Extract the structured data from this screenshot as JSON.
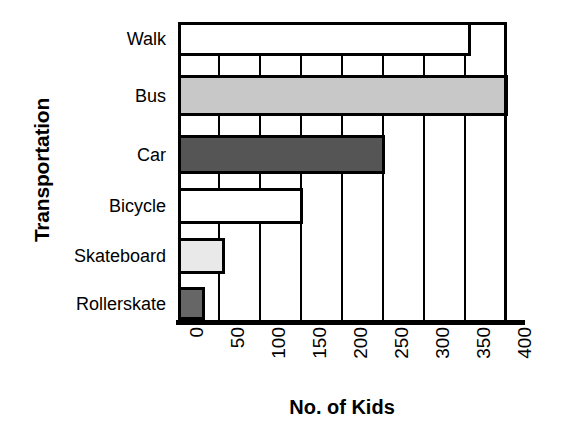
{
  "chart_data": {
    "type": "bar",
    "orientation": "horizontal",
    "title": "",
    "xlabel": "No. of Kids",
    "ylabel": "Transportation",
    "categories": [
      "Walk",
      "Bus",
      "Car",
      "Bicycle",
      "Skateboard",
      "Rollerskate"
    ],
    "values": [
      355,
      400,
      250,
      150,
      55,
      30
    ],
    "xlim": [
      0,
      400
    ],
    "xticks": [
      0,
      50,
      100,
      150,
      200,
      250,
      300,
      350,
      400
    ],
    "xtick_labels": [
      "0",
      "50",
      "100",
      "150",
      "200",
      "250",
      "300",
      "350",
      "400"
    ],
    "grid": true,
    "grid_axis": "x",
    "legend": false,
    "bar_colors": [
      "#ffffff",
      "#c8c8c8",
      "#555555",
      "#ffffff",
      "#e9e9e9",
      "#666666"
    ],
    "bar_edge_color": "#000000",
    "bars": [
      {
        "category": "Walk",
        "value": 355,
        "fill": "#ffffff"
      },
      {
        "category": "Bus",
        "value": 400,
        "fill": "#c8c8c8"
      },
      {
        "category": "Car",
        "value": 250,
        "fill": "#555555"
      },
      {
        "category": "Bicycle",
        "value": 150,
        "fill": "#ffffff"
      },
      {
        "category": "Skateboard",
        "value": 55,
        "fill": "#e9e9e9"
      },
      {
        "category": "Rollerskate",
        "value": 30,
        "fill": "#666666"
      }
    ]
  }
}
